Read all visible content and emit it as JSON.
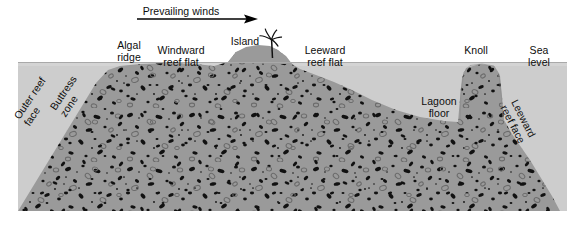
{
  "diagram": {
    "wind_annotation": {
      "label": "Prevailing winds",
      "direction": "left-to-right",
      "arrow_icon": "right-arrow-icon"
    },
    "labels": {
      "algal_ridge": "Algal\nridge",
      "windward_reef_flat": "Windward\nreef flat",
      "island": "Island",
      "leeward_reef_flat": "Leeward\nreef flat",
      "knoll": "Knoll",
      "sea_level": "Sea\nlevel",
      "lagoon_floor": "Lagoon\nfloor",
      "outer_reef_face": "Outer reef\nface",
      "buttress_zone": "Buttress\nzone",
      "leeward_reef_face": "Leeward\nreef face"
    },
    "colors": {
      "reef_body": "#9a9a9a",
      "sea_water": "#cfcfcf",
      "background": "#ffffff",
      "speckle_dark": "#111111",
      "speckle_outline": "#6e6e6e",
      "text": "#0d0d0d",
      "arrow": "#000000"
    },
    "features": [
      {
        "name": "outer-reef-face",
        "side": "left",
        "description": "steep seaward slope"
      },
      {
        "name": "buttress-zone",
        "side": "left",
        "description": "spur and groove zone"
      },
      {
        "name": "algal-ridge",
        "side": "left-crest",
        "description": "wave-resistant crest"
      },
      {
        "name": "windward-reef-flat",
        "side": "left",
        "description": "shallow flat at sea level"
      },
      {
        "name": "island",
        "side": "center",
        "description": "emergent sand cay with palm"
      },
      {
        "name": "leeward-reef-flat",
        "side": "right",
        "description": "shallow flat sloping to lagoon"
      },
      {
        "name": "lagoon-floor",
        "side": "right-center",
        "description": "deeper lagoon basin"
      },
      {
        "name": "knoll",
        "side": "right",
        "description": "patch-reef pinnacle to sea level"
      },
      {
        "name": "leeward-reef-face",
        "side": "right",
        "description": "back-reef slope"
      }
    ],
    "palm_tree": {
      "icon": "palm-tree-icon",
      "location": "island"
    }
  }
}
